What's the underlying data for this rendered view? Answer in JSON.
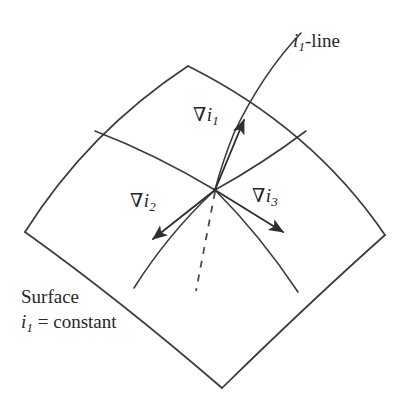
{
  "figure": {
    "background_color": "#ffffff",
    "stroke_color": "#3a3a42",
    "text_color": "#26262c"
  },
  "labels": {
    "i1_line": {
      "symbol": "i",
      "subscript": "1",
      "suffix": "-line",
      "full": "i1-line"
    },
    "grad_i1": {
      "nabla": "∇",
      "symbol": "i",
      "subscript": "1",
      "full": "∇i1"
    },
    "grad_i2": {
      "nabla": "∇",
      "symbol": "i",
      "subscript": "2",
      "full": "∇i2"
    },
    "grad_i3": {
      "nabla": "∇",
      "symbol": "i",
      "subscript": "3",
      "full": "∇i3"
    }
  },
  "caption": {
    "line1": "Surface",
    "line2_symbol": "i",
    "line2_subscript": "1",
    "line2_rest": " = constant",
    "full": "Surface i1 = constant"
  },
  "geometry": {
    "patch_outline": "M 25 232 L 188 66 L 385 235 L 222 388 Z",
    "center_point": {
      "x": 215,
      "y": 190
    },
    "top_apex": {
      "x": 188,
      "y": 66
    },
    "left_corner": {
      "x": 25,
      "y": 232
    },
    "right_corner": {
      "x": 385,
      "y": 235
    },
    "bottom_vertex": {
      "x": 222,
      "y": 388
    },
    "arrows": {
      "grad_i1_tip": {
        "x": 246,
        "y": 116
      },
      "grad_i2_tip": {
        "x": 148,
        "y": 243
      },
      "grad_i3_tip": {
        "x": 288,
        "y": 236
      }
    },
    "dashed_line": {
      "from": {
        "x": 215,
        "y": 192
      },
      "to": {
        "x": 196,
        "y": 291
      }
    },
    "i1_line_top": {
      "x": 301,
      "y": 33
    }
  }
}
